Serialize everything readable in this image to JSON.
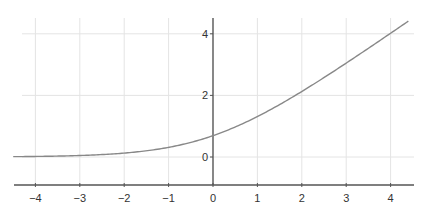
{
  "chart_data": {
    "type": "line",
    "title": "",
    "xlabel": "",
    "ylabel": "",
    "function": "softplus: y = ln(1 + e^x)",
    "xlim": [
      -4.5,
      4.5
    ],
    "ylim": [
      -0.9,
      4.5
    ],
    "grid": true,
    "legend": null,
    "x_ticks": [
      -4,
      -3,
      -2,
      -1,
      0,
      1,
      2,
      3,
      4
    ],
    "x_tick_labels": [
      "−4",
      "−3",
      "−2",
      "−1",
      "0",
      "1",
      "2",
      "3",
      "4"
    ],
    "y_ticks": [
      0,
      2,
      4
    ],
    "y_tick_labels": [
      "0",
      "2",
      "4"
    ],
    "series": [
      {
        "name": "softplus",
        "color": "#888888",
        "x": [
          -4.5,
          -4,
          -3.5,
          -3,
          -2.5,
          -2,
          -1.5,
          -1,
          -0.5,
          0,
          0.5,
          1,
          1.5,
          2,
          2.5,
          3,
          3.5,
          4,
          4.4
        ],
        "values": [
          0.011,
          0.018,
          0.03,
          0.049,
          0.079,
          0.127,
          0.201,
          0.313,
          0.474,
          0.693,
          0.974,
          1.313,
          1.701,
          2.127,
          2.579,
          3.049,
          3.53,
          4.018,
          4.412
        ]
      }
    ],
    "colors": {
      "axis": "#555555",
      "grid": "#e4e4e4",
      "curve": "#888888",
      "labels": "#333333"
    }
  }
}
